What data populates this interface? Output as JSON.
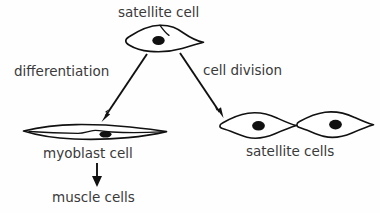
{
  "figure": {
    "type": "biology-process-diagram",
    "topic": "Satellite cell fate: differentiation versus cell division",
    "background_color": "#fefefe",
    "ink_color": "#111111",
    "text_color": "#3a3a3a"
  },
  "nodes": {
    "satellite_cell": {
      "label": "satellite cell",
      "shape": "flattened-satellite-cell",
      "nucleus": "filled-oval"
    },
    "myoblast_cell": {
      "label": "myoblast cell",
      "shape": "elongated-spindle-cell",
      "nucleus": "filled-oval"
    },
    "satellite_cells": {
      "label": "satellite cells",
      "shape": "two-spindle-cells",
      "count": 2,
      "nucleus": "filled-oval"
    },
    "muscle_cells": {
      "label": "muscle cells",
      "shape": "text-only"
    }
  },
  "edges": [
    {
      "id": "differentiation",
      "label": "differentiation",
      "from": "satellite_cell",
      "to": "myoblast_cell",
      "direction": "down-left"
    },
    {
      "id": "cell-division",
      "label": "cell division",
      "from": "satellite_cell",
      "to": "satellite_cells",
      "direction": "down-right"
    },
    {
      "id": "maturation",
      "label": "",
      "from": "myoblast_cell",
      "to": "muscle_cells",
      "direction": "down"
    }
  ]
}
